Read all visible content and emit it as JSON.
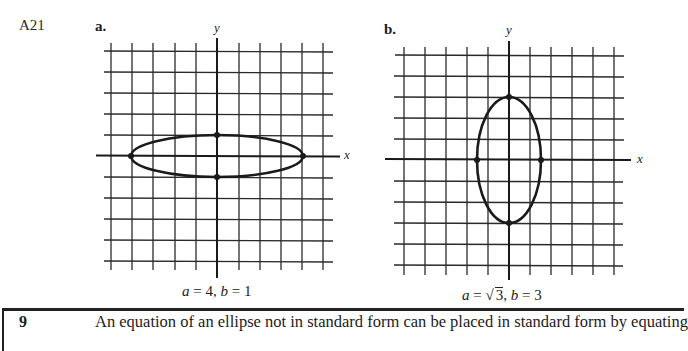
{
  "page": {
    "item_number": "A21"
  },
  "graphs": [
    {
      "part_label": "a.",
      "y_axis_label": "y",
      "x_axis_label": "x",
      "caption": {
        "a_label": "a",
        "eq1": " = 4, ",
        "b_label": "b",
        "eq2": " = 1"
      },
      "ellipse": {
        "a": 4,
        "b": 1,
        "vertices": [
          [
            -4,
            0
          ],
          [
            4,
            0
          ],
          [
            0,
            1
          ],
          [
            0,
            -1
          ]
        ]
      }
    },
    {
      "part_label": "b.",
      "y_axis_label": "y",
      "x_axis_label": "x",
      "caption": {
        "a_label": "a",
        "eq1": " = ",
        "sqrt_value": "3",
        "eq2": ", ",
        "b_label": "b",
        "eq3": " = 3"
      },
      "ellipse": {
        "a": "√3",
        "b": 3,
        "vertices": [
          [
            -1.732,
            0
          ],
          [
            1.732,
            0
          ],
          [
            0,
            3
          ],
          [
            0,
            -3
          ]
        ]
      }
    }
  ],
  "next_section": {
    "number": "9",
    "text": "An equation of an ellipse not in standard form can be placed in standard form by equating"
  }
}
